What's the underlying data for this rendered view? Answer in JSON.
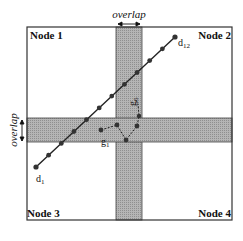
{
  "diagram": {
    "nodes": [
      {
        "label": "Node 1",
        "position": "top-left"
      },
      {
        "label": "Node 2",
        "position": "top-right"
      },
      {
        "label": "Node 3",
        "position": "bottom-left"
      },
      {
        "label": "Node 4",
        "position": "bottom-right"
      }
    ],
    "overlap_top_label": "overlap",
    "overlap_left_label": "overlap",
    "trajectory_d": {
      "start_label": "d",
      "start_sub": "1",
      "end_label": "d",
      "end_sub": "12",
      "points": 12
    },
    "trajectory_g": {
      "start_label": "g",
      "start_sub": "1",
      "end_label": "g",
      "end_sub": "6",
      "points": 6
    },
    "colors": {
      "overlap_fill": "#a8a8a8",
      "line": "#222222",
      "border": "#333333"
    }
  }
}
